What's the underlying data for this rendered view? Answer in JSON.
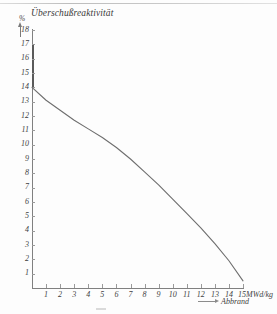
{
  "chart_data": {
    "type": "line",
    "title": "Überschußreaktivität",
    "ylabel": "%",
    "xlabel": "Abbrand",
    "xunit": "15MWd/kg",
    "x_axis_unit_label": "15MWd/kg",
    "xlim": [
      0,
      15
    ],
    "ylim": [
      0,
      18
    ],
    "grid": false,
    "legend": false,
    "y_ticks": [
      18,
      17,
      16,
      15,
      14,
      13,
      12,
      11,
      10,
      9,
      8,
      7,
      6,
      5,
      4,
      3,
      2,
      1
    ],
    "x_ticks": [
      1,
      2,
      3,
      4,
      5,
      6,
      7,
      8,
      9,
      10,
      11,
      12,
      13,
      14,
      15
    ],
    "x_tick_labels": [
      "1",
      "2",
      "3",
      "4",
      "5",
      "6",
      "7",
      "8",
      "9",
      "10",
      "11",
      "12",
      "13",
      "14",
      "15"
    ],
    "series": [
      {
        "name": "Überschußreaktivität",
        "color": "#6e6e6e",
        "x": [
          0,
          1,
          2,
          3,
          4,
          5,
          6,
          7,
          8,
          9,
          10,
          11,
          12,
          13,
          14,
          15
        ],
        "values": [
          14.0,
          13.1,
          12.4,
          11.7,
          11.1,
          10.5,
          9.8,
          9.0,
          8.1,
          7.2,
          6.2,
          5.2,
          4.2,
          3.1,
          1.9,
          0.5
        ]
      }
    ],
    "annotations": {
      "y_axis_emphasis_range": [
        15,
        18
      ],
      "curve_start_value": 14.0,
      "curve_end_value": 0.5
    }
  },
  "axis": {
    "y_unit": "%",
    "x_caption": "Abbrand",
    "x_unit_text": "15MWd/kg"
  },
  "icons": {
    "y_axis_arrow": "arrow-up-icon",
    "x_caption_arrow": "arrow-right-icon"
  }
}
